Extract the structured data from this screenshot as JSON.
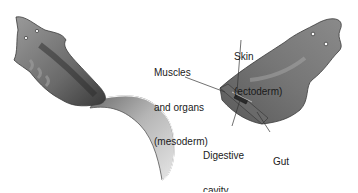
{
  "diagram": {
    "labels": {
      "skin": {
        "line1": "Skin",
        "line2": "(ectoderm)"
      },
      "muscles": {
        "line1": "Muscles",
        "line2": "and organs",
        "line3": "(mesoderm)"
      },
      "digestive": {
        "line1": "Digestive",
        "line2": "cavity"
      },
      "gut": {
        "line1": "Gut",
        "line2": "(endoderm)"
      }
    },
    "colors": {
      "body_dark": "#4a4a4a",
      "body_mid": "#8c8c8c",
      "body_light": "#c8c8c8",
      "leader_line": "#333333",
      "text": "#1a1a1a"
    }
  }
}
